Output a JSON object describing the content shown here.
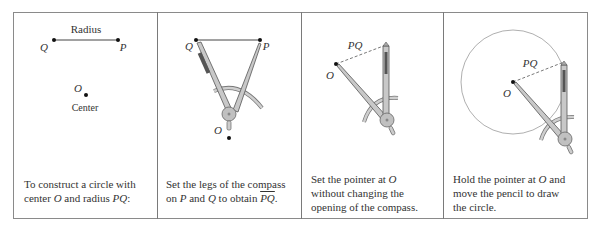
{
  "figure": {
    "panels": [
      {
        "id": "panel-1",
        "labels": {
          "radius": "Radius",
          "q": "Q",
          "p": "P",
          "o": "O",
          "center": "Center"
        },
        "caption": {
          "line1": "To construct a circle with",
          "line2_prefix": "center ",
          "line2_o": "O",
          "line2_mid": " and radius ",
          "line2_pq": "PQ",
          "line2_suffix": ":"
        }
      },
      {
        "id": "panel-2",
        "labels": {
          "q": "Q",
          "p": "P",
          "o": "O"
        },
        "caption": {
          "line1": "Set the legs of the compass",
          "line2_prefix": "on ",
          "line2_p": "P",
          "line2_mid": " and ",
          "line2_q": "Q",
          "line2_mid2": " to obtain ",
          "line2_pq": "PQ",
          "line2_suffix": "."
        }
      },
      {
        "id": "panel-3",
        "labels": {
          "pq": "PQ",
          "o": "O"
        },
        "caption": {
          "line1_prefix": "Set the pointer at ",
          "line1_o": "O",
          "line2": "without changing the",
          "line3": "opening of the compass."
        }
      },
      {
        "id": "panel-4",
        "labels": {
          "pq": "PQ",
          "o": "O"
        },
        "caption": {
          "line1_prefix": "Hold the pointer at ",
          "line1_o": "O",
          "line1_suffix": " and",
          "line2": "move the pencil to draw",
          "line3": "the circle."
        }
      }
    ],
    "colors": {
      "border": "#8a8a8a",
      "compass_fill": "#c8c8c8",
      "compass_stroke": "#6a6a6a",
      "text": "#333333",
      "circle": "#9a9a9a"
    }
  }
}
